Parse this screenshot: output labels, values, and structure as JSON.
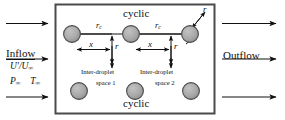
{
  "figure": {
    "type": "schematic-diagram"
  },
  "boundaries": {
    "top_label": "cyclic",
    "bottom_label": "cyclic"
  },
  "inflow": {
    "title": "Inflow",
    "velocity": "U'/U",
    "velocity_sub": "∞",
    "pressure": "P",
    "pressure_sub": "∞",
    "temperature": "T",
    "temperature_sub": "∞",
    "arrow_count": 3
  },
  "outflow": {
    "title": "Outflow",
    "arrow_count": 3
  },
  "dimensions": {
    "rc_left": "r",
    "rc_left_sub": "c",
    "rc_right": "r",
    "rc_right_sub": "c",
    "x_left": "x",
    "x_right": "x",
    "r_left": "r",
    "r_right": "r",
    "droplet_radius_callout": "r"
  },
  "spaces": [
    {
      "line1": "Inter-droplet",
      "line2": "space 1"
    },
    {
      "line1": "Inter-droplet",
      "line2": "space 2"
    }
  ],
  "droplets": {
    "top_row_count": 3,
    "bottom_row_count": 3,
    "fill_color": "#a8a8a8",
    "stroke_color": "#3d3d3d"
  },
  "colors": {
    "domain_border": "#4a4a4a",
    "line": "#1a1a1a",
    "text": "#111111",
    "background": "#ffffff"
  }
}
